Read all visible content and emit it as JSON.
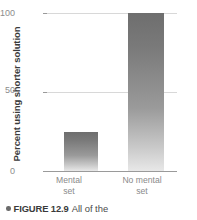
{
  "chart_data": {
    "type": "bar",
    "title": "",
    "xlabel": "",
    "ylabel": "Percent using shorter solution",
    "categories": [
      "Mental set",
      "No mental set"
    ],
    "category_lines": [
      [
        "Mental",
        "set"
      ],
      [
        "No mental",
        "set"
      ]
    ],
    "values": [
      25,
      100
    ],
    "ylim": [
      0,
      100
    ],
    "yticks": [
      0,
      50,
      100
    ],
    "ytick_labels": [
      "0",
      "50",
      "100"
    ],
    "grid": true,
    "gridlines_at": [
      50,
      100
    ],
    "legend": null,
    "bar_fill": "gradient-gray-dark-top-to-light-bottom",
    "bar_color_top": "#6e6e6e",
    "bar_color_bottom": "#e8e8e8",
    "grid_color": "#d8d8d8",
    "axis_color": "#9a9a9a",
    "tick_label_color": "#8c8c8c",
    "axis_title_color": "#3a3a3a"
  },
  "caption": {
    "bullet": "bullet-icon",
    "figure_number": "FIGURE 12.9",
    "text": "All of the"
  }
}
